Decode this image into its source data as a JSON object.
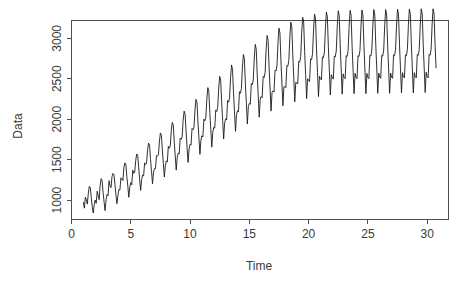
{
  "chart_data": {
    "type": "line",
    "title": "",
    "subtitle": "",
    "xlabel": "Time",
    "ylabel": "Data",
    "xlim": [
      0,
      31.8
    ],
    "ylim": [
      760,
      3220
    ],
    "grid": false,
    "legend": null,
    "annotations": [],
    "series_name": "Data",
    "line_color": "#1a1a1a",
    "background_color": "#ffffff",
    "axis_color": "#4d4d4d",
    "x_ticks": [
      0,
      5,
      10,
      15,
      20,
      25,
      30
    ],
    "x_tick_labels": [
      "0",
      "5",
      "10",
      "15",
      "20",
      "25",
      "30"
    ],
    "y_ticks": [
      1000,
      1500,
      2000,
      2500,
      3000
    ],
    "y_tick_labels": [
      "1000",
      "1500",
      "2000",
      "2500",
      "3000"
    ],
    "points_per_unit": 12,
    "x_start": 1.0,
    "x_end": 30.75,
    "x": [
      1.0,
      1.083,
      1.167,
      1.25,
      1.333,
      1.417,
      1.5,
      1.583,
      1.667,
      1.75,
      1.833,
      1.917,
      2.0,
      2.083,
      2.167,
      2.25,
      2.333,
      2.417,
      2.5,
      2.583,
      2.667,
      2.75,
      2.833,
      2.917,
      3.0,
      3.083,
      3.167,
      3.25,
      3.333,
      3.417,
      3.5,
      3.583,
      3.667,
      3.75,
      3.833,
      3.917,
      4.0,
      4.083,
      4.167,
      4.25,
      4.333,
      4.417,
      4.5,
      4.583,
      4.667,
      4.75,
      4.833,
      4.917,
      5.0,
      5.083,
      5.167,
      5.25,
      5.333,
      5.417,
      5.5,
      5.583,
      5.667,
      5.75,
      5.833,
      5.917,
      6.0,
      6.083,
      6.167,
      6.25,
      6.333,
      6.417,
      6.5,
      6.583,
      6.667,
      6.75,
      6.833,
      6.917,
      7.0,
      7.083,
      7.167,
      7.25,
      7.333,
      7.417,
      7.5,
      7.583,
      7.667,
      7.75,
      7.833,
      7.917,
      8.0,
      8.083,
      8.167,
      8.25,
      8.333,
      8.417,
      8.5,
      8.583,
      8.667,
      8.75,
      8.833,
      8.917,
      9.0,
      9.083,
      9.167,
      9.25,
      9.333,
      9.417,
      9.5,
      9.583,
      9.667,
      9.75,
      9.833,
      9.917,
      10.0,
      10.083,
      10.167,
      10.25,
      10.333,
      10.417,
      10.5,
      10.583,
      10.667,
      10.75,
      10.833,
      10.917,
      11.0,
      11.083,
      11.167,
      11.25,
      11.333,
      11.417,
      11.5,
      11.583,
      11.667,
      11.75,
      11.833,
      11.917,
      12.0,
      12.083,
      12.167,
      12.25,
      12.333,
      12.417,
      12.5,
      12.583,
      12.667,
      12.75,
      12.833,
      12.917,
      13.0,
      13.083,
      13.167,
      13.25,
      13.333,
      13.417,
      13.5,
      13.583,
      13.667,
      13.75,
      13.833,
      13.917,
      14.0,
      14.083,
      14.167,
      14.25,
      14.333,
      14.417,
      14.5,
      14.583,
      14.667,
      14.75,
      14.833,
      14.917,
      15.0,
      15.083,
      15.167,
      15.25,
      15.333,
      15.417,
      15.5,
      15.583,
      15.667,
      15.75,
      15.833,
      15.917,
      16.0,
      16.083,
      16.167,
      16.25,
      16.333,
      16.417,
      16.5,
      16.583,
      16.667,
      16.75,
      16.833,
      16.917,
      17.0,
      17.083,
      17.167,
      17.25,
      17.333,
      17.417,
      17.5,
      17.583,
      17.667,
      17.75,
      17.833,
      17.917,
      18.0,
      18.083,
      18.167,
      18.25,
      18.333,
      18.417,
      18.5,
      18.583,
      18.667,
      18.75,
      18.833,
      18.917,
      19.0,
      19.083,
      19.167,
      19.25,
      19.333,
      19.417,
      19.5,
      19.583,
      19.667,
      19.75,
      19.833,
      19.917,
      20.0,
      20.083,
      20.167,
      20.25,
      20.333,
      20.417,
      20.5,
      20.583,
      20.667,
      20.75,
      20.833,
      20.917,
      21.0,
      21.083,
      21.167,
      21.25,
      21.333,
      21.417,
      21.5,
      21.583,
      21.667,
      21.75,
      21.833,
      21.917,
      22.0,
      22.083,
      22.167,
      22.25,
      22.333,
      22.417,
      22.5,
      22.583,
      22.667,
      22.75,
      22.833,
      22.917,
      23.0,
      23.083,
      23.167,
      23.25,
      23.333,
      23.417,
      23.5,
      23.583,
      23.667,
      23.75,
      23.833,
      23.917,
      24.0,
      24.083,
      24.167,
      24.25,
      24.333,
      24.417,
      24.5,
      24.583,
      24.667,
      24.75,
      24.833,
      24.917,
      25.0,
      25.083,
      25.167,
      25.25,
      25.333,
      25.417,
      25.5,
      25.583,
      25.667,
      25.75,
      25.833,
      25.917,
      26.0,
      26.083,
      26.167,
      26.25,
      26.333,
      26.417,
      26.5,
      26.583,
      26.667,
      26.75,
      26.833,
      26.917,
      27.0,
      27.083,
      27.167,
      27.25,
      27.333,
      27.417,
      27.5,
      27.583,
      27.667,
      27.75,
      27.833,
      27.917,
      28.0,
      28.083,
      28.167,
      28.25,
      28.333,
      28.417,
      28.5,
      28.583,
      28.667,
      28.75,
      28.833,
      28.917,
      29.0,
      29.083,
      29.167,
      29.25,
      29.333,
      29.417,
      29.5,
      29.583,
      29.667,
      29.75,
      29.833,
      29.917,
      30.0,
      30.083,
      30.167,
      30.25,
      30.333,
      30.417,
      30.5,
      30.583,
      30.667,
      30.75
    ],
    "y": [
      975,
      900,
      1035,
      1010,
      950,
      1080,
      1170,
      1155,
      1030,
      915,
      840,
      945,
      1000,
      960,
      1110,
      1060,
      1005,
      1180,
      1265,
      1240,
      1090,
      975,
      870,
      1005,
      1070,
      1055,
      1240,
      1175,
      1155,
      1290,
      1330,
      1315,
      1190,
      1060,
      955,
      1060,
      1130,
      1125,
      1275,
      1260,
      1240,
      1400,
      1460,
      1440,
      1290,
      1175,
      1035,
      1160,
      1215,
      1190,
      1370,
      1330,
      1345,
      1490,
      1570,
      1555,
      1400,
      1255,
      1120,
      1255,
      1310,
      1300,
      1460,
      1440,
      1455,
      1620,
      1705,
      1680,
      1500,
      1355,
      1200,
      1345,
      1390,
      1390,
      1550,
      1545,
      1560,
      1730,
      1830,
      1800,
      1610,
      1450,
      1285,
      1430,
      1485,
      1470,
      1665,
      1640,
      1670,
      1860,
      1960,
      1930,
      1720,
      1545,
      1370,
      1525,
      1580,
      1570,
      1765,
      1750,
      1780,
      1985,
      2100,
      2060,
      1840,
      1650,
      1465,
      1630,
      1690,
      1680,
      1885,
      1870,
      1905,
      2120,
      2245,
      2205,
      1965,
      1765,
      1565,
      1740,
      1795,
      1780,
      2000,
      1980,
      2025,
      2250,
      2390,
      2345,
      2085,
      1870,
      1655,
      1840,
      1900,
      1890,
      2115,
      2095,
      2145,
      2385,
      2530,
      2480,
      2205,
      1985,
      1755,
      1950,
      2005,
      1990,
      2230,
      2210,
      2265,
      2515,
      2670,
      2615,
      2325,
      2090,
      1850,
      2055,
      2105,
      2090,
      2340,
      2320,
      2380,
      2640,
      2800,
      2745,
      2440,
      2195,
      1940,
      2155,
      2195,
      2185,
      2440,
      2425,
      2485,
      2755,
      2925,
      2865,
      2545,
      2290,
      2025,
      2245,
      2280,
      2265,
      2530,
      2515,
      2580,
      2860,
      3035,
      2975,
      2640,
      2375,
      2100,
      2330,
      2350,
      2335,
      2605,
      2595,
      2660,
      2945,
      3125,
      3065,
      2720,
      2445,
      2165,
      2400,
      2405,
      2390,
      2665,
      2655,
      2725,
      3015,
      3200,
      3140,
      2785,
      2505,
      2215,
      2455,
      2450,
      2435,
      2715,
      2705,
      2775,
      3070,
      3260,
      3200,
      2835,
      2550,
      2255,
      2500,
      2480,
      2465,
      2745,
      2735,
      2810,
      3105,
      3300,
      3240,
      2870,
      2580,
      2280,
      2530,
      2500,
      2485,
      2770,
      2760,
      2830,
      3130,
      3325,
      3265,
      2890,
      2600,
      2300,
      2550,
      2510,
      2495,
      2780,
      2770,
      2845,
      3145,
      3340,
      3280,
      2905,
      2610,
      2310,
      2560,
      2515,
      2500,
      2785,
      2775,
      2850,
      3150,
      3345,
      3285,
      2910,
      2615,
      2315,
      2565,
      2515,
      2500,
      2785,
      2775,
      2850,
      3150,
      3350,
      3285,
      2910,
      2615,
      2315,
      2565,
      2515,
      2500,
      2790,
      2780,
      2855,
      3155,
      3355,
      3290,
      2915,
      2620,
      2320,
      2570,
      2520,
      2505,
      2790,
      2780,
      2855,
      3155,
      3355,
      3290,
      2915,
      2620,
      2320,
      2570,
      2520,
      2505,
      2795,
      2785,
      2860,
      3160,
      3360,
      3295,
      2920,
      2625,
      2325,
      2575,
      2525,
      2510,
      2795,
      2785,
      2860,
      3160,
      3360,
      3295,
      2920,
      2625,
      2325,
      2575,
      2525,
      2510,
      2800,
      2790,
      2865,
      3165,
      3365,
      3300,
      2925,
      2630,
      2330,
      2580,
      2525,
      2510,
      2800,
      2790,
      2865,
      3165,
      3365,
      3300,
      2925,
      2630
    ]
  },
  "axes": {
    "y_label": "Data",
    "x_label": "Time"
  }
}
